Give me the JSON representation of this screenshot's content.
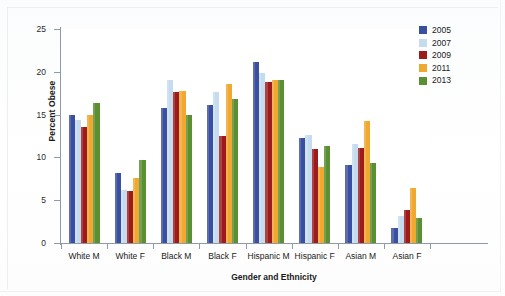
{
  "chart_data": {
    "type": "bar",
    "title": "",
    "xlabel": "Gender and Ethnicity",
    "ylabel": "Percent Obese",
    "ylim": [
      0,
      25
    ],
    "yticks": [
      0,
      5,
      10,
      15,
      20,
      25
    ],
    "grid": false,
    "legend_position": "top-right",
    "categories": [
      "White M",
      "White F",
      "Black M",
      "Black F",
      "Hispanic M",
      "Hispanic F",
      "Asian M",
      "Asian F"
    ],
    "series": [
      {
        "name": "2005",
        "color": "#3b4fa0",
        "values": [
          15.0,
          8.2,
          15.8,
          16.1,
          21.2,
          12.3,
          9.1,
          1.7
        ]
      },
      {
        "name": "2007",
        "color": "#c5dcef",
        "values": [
          14.4,
          6.2,
          19.0,
          17.7,
          19.9,
          12.6,
          11.6,
          3.1
        ]
      },
      {
        "name": "2009",
        "color": "#9e1b1b",
        "values": [
          13.6,
          6.1,
          17.6,
          12.5,
          18.8,
          11.0,
          11.1,
          3.9
        ]
      },
      {
        "name": "2011",
        "color": "#f0a830",
        "values": [
          14.9,
          7.6,
          17.8,
          18.6,
          19.0,
          8.9,
          14.2,
          6.4
        ]
      },
      {
        "name": "2013",
        "color": "#5a8f32",
        "values": [
          16.4,
          9.7,
          15.0,
          16.8,
          19.0,
          11.3,
          9.3,
          2.9
        ]
      }
    ]
  }
}
